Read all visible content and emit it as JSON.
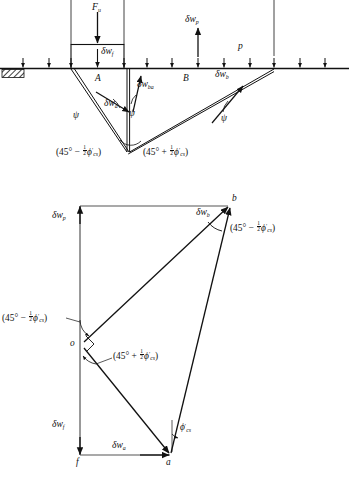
{
  "figure": {
    "domain": "geotechnical-mechanism-diagram",
    "panels": [
      {
        "id": "a",
        "label": ")",
        "full_label": "a)"
      },
      {
        "id": "b",
        "label": ")",
        "full_label": "b)"
      }
    ],
    "caption_partial": ""
  },
  "colors": {
    "line": "#111111",
    "background": "#ffffff",
    "ground": "#000000"
  },
  "top_diagram": {
    "name": "collapse-mechanism",
    "load_label": "F",
    "load_sub": "u",
    "footing_velocity": "δw",
    "footing_velocity_sub": "f",
    "uplift_velocity": "δw",
    "uplift_velocity_sub": "p",
    "surcharge_label": "p",
    "wedge_a_label": "A",
    "wedge_b_label": "B",
    "vectors": [
      {
        "name": "dw-a",
        "sym": "δw",
        "sub": "a"
      },
      {
        "name": "dw-ba",
        "sym": "δw",
        "sub": "ba"
      },
      {
        "name": "dw-b",
        "sym": "δw",
        "sub": "b"
      }
    ],
    "dilation_angles": [
      {
        "name": "psi-left",
        "sym": "ψ"
      },
      {
        "name": "psi-mid",
        "sym": "ψ"
      },
      {
        "name": "psi-right",
        "sym": "ψ"
      }
    ],
    "angle_left": {
      "open": "(45° − ",
      "frac_n": "1",
      "frac_d": "2",
      "phi": "ϕ",
      "prime": "′",
      "sub": "cs",
      "close": ")"
    },
    "angle_right": {
      "open": "(45° + ",
      "frac_n": "1",
      "frac_d": "2",
      "phi": "ϕ",
      "prime": "′",
      "sub": "cs",
      "close": ")"
    }
  },
  "hodograph": {
    "name": "velocity-diagram",
    "points": [
      {
        "name": "point-o",
        "label": "o"
      },
      {
        "name": "point-b",
        "label": "b"
      },
      {
        "name": "point-a",
        "label": "a"
      },
      {
        "name": "point-f",
        "label": "f"
      }
    ],
    "vectors": [
      {
        "name": "dw-p",
        "sym": "δw",
        "sub": "p"
      },
      {
        "name": "dw-b",
        "sym": "δw",
        "sub": "b"
      },
      {
        "name": "dw-f",
        "sym": "δw",
        "sub": "f"
      },
      {
        "name": "dw-a",
        "sym": "δw",
        "sub": "a"
      }
    ],
    "angle_b": {
      "open": "(45° − ",
      "frac_n": "1",
      "frac_d": "2",
      "phi": "ϕ",
      "prime": "′",
      "sub": "cs",
      "close": ")"
    },
    "angle_o_upper": {
      "open": "(45° − ",
      "frac_n": "1",
      "frac_d": "2",
      "phi": "ϕ",
      "prime": "′",
      "sub": "cs",
      "close": ")"
    },
    "angle_o_lower": {
      "open": "(45° + ",
      "frac_n": "1",
      "frac_d": "2",
      "phi": "ϕ",
      "prime": "′",
      "sub": "cs",
      "close": ")"
    },
    "angle_a": {
      "phi": "ϕ",
      "prime": "′",
      "sub": "cs"
    }
  }
}
